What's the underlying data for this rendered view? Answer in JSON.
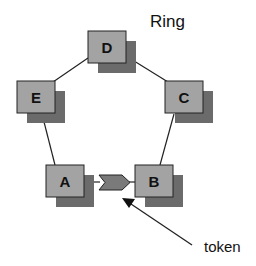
{
  "title": "Ring",
  "annotation": "token",
  "colors": {
    "node_fill": "#a3a3a3",
    "node_shadow": "#6b6b6b",
    "node_border": "#222222",
    "token_fill": "#7a7a7a",
    "edge": "#222222"
  },
  "nodes": [
    {
      "id": "D",
      "label": "D",
      "x": 88,
      "y": 31
    },
    {
      "id": "C",
      "label": "C",
      "x": 165,
      "y": 81
    },
    {
      "id": "B",
      "label": "B",
      "x": 135,
      "y": 165
    },
    {
      "id": "A",
      "label": "A",
      "x": 46,
      "y": 165
    },
    {
      "id": "E",
      "label": "E",
      "x": 17,
      "y": 81
    }
  ],
  "edges": [
    [
      "D",
      "C"
    ],
    [
      "C",
      "B"
    ],
    [
      "B",
      "A"
    ],
    [
      "A",
      "E"
    ],
    [
      "E",
      "D"
    ]
  ],
  "token": {
    "between": [
      "A",
      "B"
    ],
    "direction": "A-to-B"
  }
}
